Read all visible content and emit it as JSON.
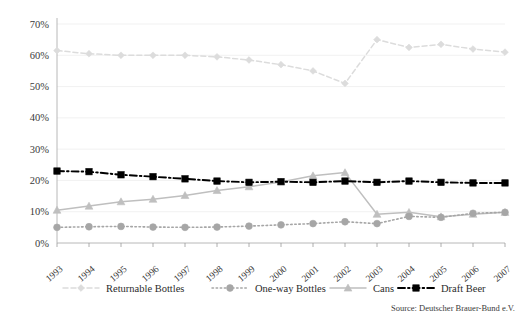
{
  "chart_data": {
    "type": "line",
    "title": "",
    "xlabel": "",
    "ylabel": "",
    "categories": [
      "1993",
      "1994",
      "1995",
      "1996",
      "1997",
      "1998",
      "1999",
      "2000",
      "2001",
      "2002",
      "2003",
      "2004",
      "2005",
      "2006",
      "2007"
    ],
    "ylim": [
      0,
      70
    ],
    "ytick_labels": [
      "0%",
      "10%",
      "20%",
      "30%",
      "40%",
      "50%",
      "60%",
      "70%"
    ],
    "ytick_values": [
      0,
      10,
      20,
      30,
      40,
      50,
      60,
      70
    ],
    "grid": "horizontal",
    "legend_position": "bottom",
    "series": [
      {
        "name": "Returnable Bottles",
        "color": "#dcdcdc",
        "marker": "diamond",
        "line_style": "dashed",
        "values": [
          61.5,
          60.5,
          60.0,
          60.0,
          60.0,
          59.5,
          58.5,
          57.0,
          55.0,
          51.0,
          65.0,
          62.5,
          63.5,
          62.0,
          61.0
        ]
      },
      {
        "name": "One-way Bottles",
        "color": "#a6a6a6",
        "marker": "circle",
        "line_style": "dotted",
        "values": [
          5.0,
          5.2,
          5.3,
          5.1,
          5.0,
          5.1,
          5.4,
          5.8,
          6.2,
          6.8,
          6.2,
          8.5,
          8.2,
          9.5,
          9.8
        ]
      },
      {
        "name": "Cans",
        "color": "#bfbfbf",
        "marker": "triangle",
        "line_style": "solid",
        "values": [
          10.5,
          11.8,
          13.2,
          14.0,
          15.2,
          16.8,
          18.0,
          19.5,
          21.5,
          22.5,
          9.2,
          9.8,
          8.4,
          9.2,
          9.8
        ]
      },
      {
        "name": "Draft Beer",
        "color": "#000000",
        "marker": "square",
        "line_style": "dashdot",
        "values": [
          23.0,
          22.8,
          21.8,
          21.2,
          20.5,
          19.8,
          19.4,
          19.6,
          19.4,
          19.8,
          19.4,
          19.8,
          19.4,
          19.2,
          19.2
        ]
      }
    ],
    "source": "Source: Deutscher Brauer-Bund e.V."
  }
}
